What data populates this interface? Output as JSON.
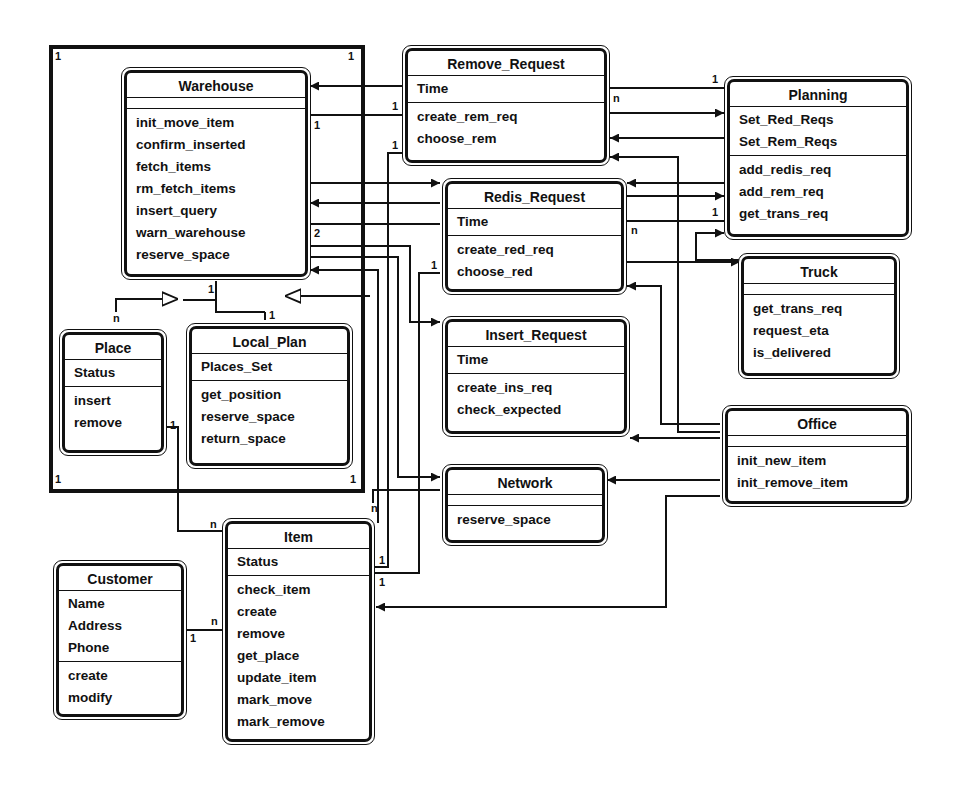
{
  "diagram": {
    "type": "UML class diagram",
    "package_frame": {
      "label": "Warehouse package",
      "corner_multiplicities": [
        "1",
        "1",
        "1",
        "1"
      ]
    },
    "classes": {
      "warehouse": {
        "name": "Warehouse",
        "attributes": [],
        "operations": [
          "init_move_item",
          "confirm_inserted",
          "fetch_items",
          "rm_fetch_items",
          "insert_query",
          "warn_warehouse",
          "reserve_space"
        ]
      },
      "place": {
        "name": "Place",
        "attributes": [
          "Status"
        ],
        "operations": [
          "insert",
          "remove"
        ]
      },
      "local_plan": {
        "name": "Local_Plan",
        "attributes": [
          "Places_Set"
        ],
        "operations": [
          "get_position",
          "reserve_space",
          "return_space"
        ]
      },
      "remove_request": {
        "name": "Remove_Request",
        "attributes": [
          "Time"
        ],
        "operations": [
          "create_rem_req",
          "choose_rem"
        ]
      },
      "redis_request": {
        "name": "Redis_Request",
        "attributes": [
          "Time"
        ],
        "operations": [
          "create_red_req",
          "choose_red"
        ]
      },
      "insert_request": {
        "name": "Insert_Request",
        "attributes": [
          "Time"
        ],
        "operations": [
          "create_ins_req",
          "check_expected"
        ]
      },
      "network": {
        "name": "Network",
        "attributes": [],
        "operations": [
          "reserve_space"
        ]
      },
      "planning": {
        "name": "Planning",
        "attributes": [
          "Set_Red_Reqs",
          "Set_Rem_Reqs"
        ],
        "operations": [
          "add_redis_req",
          "add_rem_req",
          "get_trans_req"
        ]
      },
      "truck": {
        "name": "Truck",
        "attributes": [],
        "operations": [
          "get_trans_req",
          "request_eta",
          "is_delivered"
        ]
      },
      "office": {
        "name": "Office",
        "attributes": [],
        "operations": [
          "init_new_item",
          "init_remove_item"
        ]
      },
      "item": {
        "name": "Item",
        "attributes": [
          "Status"
        ],
        "operations": [
          "check_item",
          "create",
          "remove",
          "get_place",
          "update_item",
          "mark_move",
          "mark_remove"
        ]
      },
      "customer": {
        "name": "Customer",
        "attributes": [
          "Name",
          "Address",
          "Phone"
        ],
        "operations": [
          "create",
          "modify"
        ]
      }
    },
    "multiplicities": {
      "wh_rr_1": "1",
      "rr_wh_1": "1",
      "rr_item_1": "1",
      "wh_2": "2",
      "red_item_1": "1",
      "rr_plan_n": "n",
      "plan_rr_1": "1",
      "red_plan_n": "n",
      "plan_red_1": "1",
      "wh_parts_1": "1",
      "place_n": "n",
      "lp_1": "1",
      "place_item_1": "1",
      "item_place_n": "n",
      "item_wh_n": "n",
      "item_rr_1": "1",
      "item_red_1": "1",
      "cust_1": "1",
      "item_cust_n": "n"
    }
  }
}
